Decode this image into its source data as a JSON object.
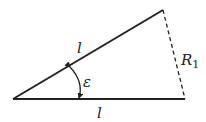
{
  "diagram": {
    "type": "isosceles-triangle",
    "colors": {
      "stroke": "#222222",
      "background": "#ffffff"
    },
    "vertices": {
      "apex_left": [
        13,
        99
      ],
      "top_right": [
        163,
        10
      ],
      "bottom_right": [
        185,
        99
      ]
    },
    "labels": {
      "upper_side": "l",
      "lower_side": "l",
      "angle": "ε",
      "chord_main": "R",
      "chord_sub": "1"
    },
    "edges": [
      {
        "name": "upper-side",
        "style": "solid",
        "label": "l"
      },
      {
        "name": "lower-side",
        "style": "solid",
        "label": "l"
      },
      {
        "name": "chord",
        "style": "dashed",
        "label": "R1"
      }
    ],
    "angle_marker": {
      "symbol": "ε",
      "style": "double-headed arc"
    }
  }
}
